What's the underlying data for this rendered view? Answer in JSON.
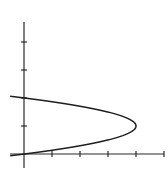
{
  "chart_data": {
    "type": "line",
    "title": "",
    "xlabel": "",
    "ylabel": "",
    "grid": false,
    "legend": null,
    "xlim": [
      -0.5,
      5
    ],
    "ylim": [
      -0.5,
      4.7
    ],
    "x_ticks": [
      1,
      2,
      3,
      4,
      5
    ],
    "y_ticks": [
      1,
      2,
      3,
      4
    ],
    "x_tick_labels": [],
    "y_tick_labels": [],
    "series": [
      {
        "name": "parabola x = 8y - 4y^2",
        "points": [
          {
            "x": -0.5,
            "y": -0.06
          },
          {
            "x": 0,
            "y": 0
          },
          {
            "x": 1.75,
            "y": 0.25
          },
          {
            "x": 3,
            "y": 0.5
          },
          {
            "x": 3.75,
            "y": 0.75
          },
          {
            "x": 4,
            "y": 1
          },
          {
            "x": 3.75,
            "y": 1.25
          },
          {
            "x": 3,
            "y": 1.5
          },
          {
            "x": 1.75,
            "y": 1.75
          },
          {
            "x": 0,
            "y": 2
          },
          {
            "x": -0.5,
            "y": 2.06
          }
        ]
      }
    ],
    "annotations": []
  },
  "layout": {
    "origin_px": [
      24,
      154
    ],
    "unit_px": 28,
    "x_axis_px": [
      10,
      164
    ],
    "y_axis_px": [
      22,
      168
    ]
  }
}
